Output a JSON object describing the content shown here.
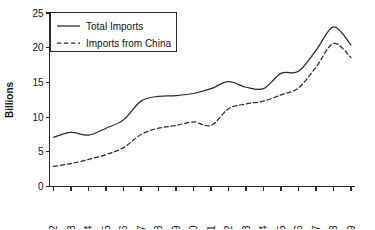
{
  "chart_data": {
    "type": "line",
    "title": "",
    "xlabel": "",
    "ylabel": "Billions",
    "ylim": [
      0,
      25
    ],
    "yticks": [
      0,
      5,
      10,
      15,
      20,
      25
    ],
    "grid": false,
    "legend_position": "top-left",
    "x": [
      1992,
      1993,
      1994,
      1995,
      1996,
      1997,
      1998,
      1999,
      2000,
      2001,
      2002,
      2003,
      2004,
      2005,
      2006,
      2007,
      2008,
      2009
    ],
    "categories": [
      "1992",
      "1993",
      "1994",
      "1995",
      "1996",
      "1997",
      "1998",
      "1999",
      "2000",
      "2001",
      "2002",
      "2003",
      "2004",
      "2005",
      "2006",
      "2007",
      "2008",
      "2009"
    ],
    "series": [
      {
        "name": "Total Imports",
        "style": "solid",
        "color": "#2a2a2a",
        "values": [
          7.1,
          7.8,
          7.4,
          8.4,
          9.6,
          12.3,
          13.0,
          13.1,
          13.4,
          14.1,
          15.1,
          14.3,
          14.1,
          16.3,
          16.6,
          19.6,
          23.0,
          20.4
        ]
      },
      {
        "name": "Imports from China",
        "style": "dashed",
        "color": "#2a2a2a",
        "values": [
          2.9,
          3.3,
          3.9,
          4.6,
          5.6,
          7.5,
          8.4,
          8.8,
          9.3,
          8.8,
          11.2,
          11.9,
          12.3,
          13.2,
          14.2,
          17.2,
          20.6,
          18.6
        ]
      }
    ]
  },
  "legend": {
    "entries": [
      {
        "label": "Total Imports",
        "style": "solid"
      },
      {
        "label": "Imports from China",
        "style": "dashed"
      }
    ]
  },
  "axes": {
    "y_title": "Billions",
    "y_tick_labels": [
      "0",
      "5",
      "10",
      "15",
      "20",
      "25"
    ],
    "x_tick_labels": [
      "1992",
      "1993",
      "1994",
      "1995",
      "1996",
      "1997",
      "1998",
      "1999",
      "2000",
      "2001",
      "2002",
      "2003",
      "2004",
      "2005",
      "2006",
      "2007",
      "2008",
      "2009"
    ]
  }
}
